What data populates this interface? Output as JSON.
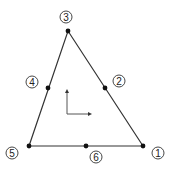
{
  "diagram": {
    "colors": {
      "line": "#333333",
      "node": "#111111",
      "background": "#ffffff"
    },
    "nodes": [
      {
        "id": "1",
        "label": "1",
        "x": 143,
        "y": 146,
        "lx": 158,
        "ly": 153
      },
      {
        "id": "2",
        "label": "2",
        "x": 105,
        "y": 88,
        "lx": 119,
        "ly": 81
      },
      {
        "id": "3",
        "label": "3",
        "x": 68,
        "y": 31,
        "lx": 66,
        "ly": 17
      },
      {
        "id": "4",
        "label": "4",
        "x": 48,
        "y": 88,
        "lx": 32,
        "ly": 82
      },
      {
        "id": "5",
        "label": "5",
        "x": 29,
        "y": 146,
        "lx": 12,
        "ly": 153
      },
      {
        "id": "6",
        "label": "6",
        "x": 86,
        "y": 146,
        "lx": 96,
        "ly": 157
      }
    ],
    "axes": {
      "origin": [
        67,
        114
      ],
      "up": [
        67,
        89
      ],
      "right": [
        92,
        114
      ]
    }
  }
}
